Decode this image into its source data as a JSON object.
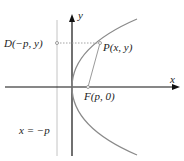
{
  "diagram": {
    "colors": {
      "axis": "#111111",
      "curve": "#8a8a8a",
      "directrix": "#bdbdbd",
      "guide": "#9a9a9a",
      "text": "#222222"
    },
    "labels": {
      "y_axis": "y",
      "x_axis": "x",
      "point_d": "D(−p, y)",
      "point_p": "P(x, y)",
      "focus": "F(p, 0)",
      "directrix": "x = −p"
    },
    "geometry": {
      "origin": [
        72,
        87
      ],
      "focus": [
        88,
        87
      ],
      "point_p": [
        100,
        43
      ],
      "point_d": [
        57,
        43
      ],
      "directrix_x": 57,
      "curve_top_end": [
        137,
        19
      ],
      "curve_bottom_end": [
        137,
        155
      ]
    }
  }
}
